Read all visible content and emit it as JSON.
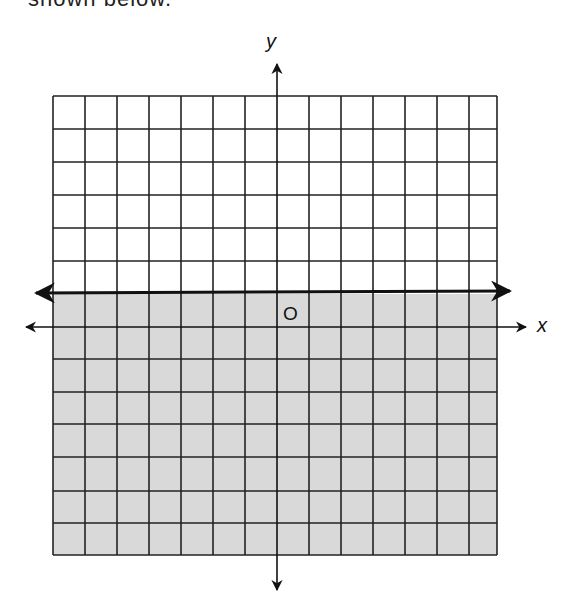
{
  "caption_fragment": "shown below.",
  "graph": {
    "x_axis_label": "x",
    "y_axis_label": "y",
    "origin_label": "O",
    "grid": {
      "columns": 14,
      "rows": 14,
      "x_range": [
        -7,
        7
      ],
      "y_range": [
        -7,
        7
      ]
    },
    "boundary_line": {
      "equation": "y = 1",
      "style": "solid",
      "arrows": "both"
    },
    "shaded_region": "below boundary (y <= 1)",
    "colors": {
      "shade": "#d9d9d9",
      "grid": "#222222",
      "background": "#ffffff"
    }
  }
}
